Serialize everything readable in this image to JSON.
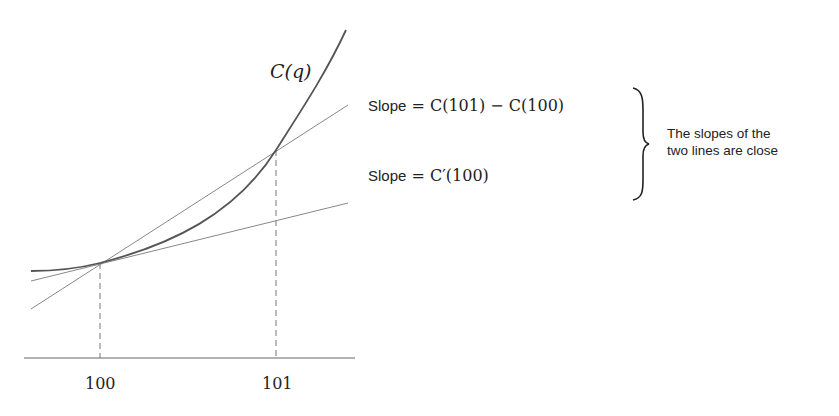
{
  "diagram": {
    "curve_label": "C(q)",
    "x_ticks": [
      "100",
      "101"
    ],
    "secant": {
      "word": "Slope",
      "equals": " = ",
      "expr": "C(101) − C(100)"
    },
    "tangent": {
      "word": "Slope",
      "equals": " = ",
      "expr": "C′(100)"
    },
    "note_line1": "The slopes of the",
    "note_line2": "two lines are close",
    "colors": {
      "curve": "#555555",
      "lines": "#777777",
      "text": "#222222"
    }
  }
}
